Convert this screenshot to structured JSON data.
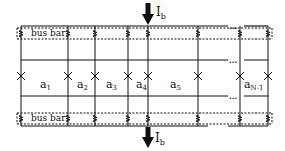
{
  "diagram": {
    "colors": {
      "line": "#111111",
      "background": "#ffffff"
    },
    "top_bus_bar": {
      "label": "bus bar"
    },
    "bottom_bus_bar": {
      "label": "bus bar"
    },
    "current_in": {
      "symbol": "I",
      "subscript": "b",
      "direction": "down"
    },
    "current_out": {
      "symbol": "I",
      "subscript": "b",
      "direction": "down"
    },
    "ellipsis": "...",
    "segments": [
      {
        "base": "a",
        "sub": "1"
      },
      {
        "base": "a",
        "sub": "2"
      },
      {
        "base": "a",
        "sub": "3"
      },
      {
        "base": "a",
        "sub": "4"
      },
      {
        "base": "a",
        "sub": "5"
      },
      {
        "base": "a",
        "sub": "N-1"
      }
    ]
  }
}
